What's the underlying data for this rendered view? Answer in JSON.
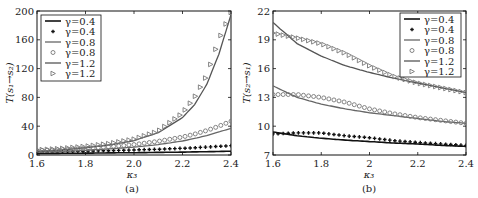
{
  "chart_data": [
    {
      "type": "line",
      "panel": "(a)",
      "title": "",
      "xlabel": "κ3",
      "ylabel": "T(s1→s2)",
      "xlim": [
        1.6,
        2.4
      ],
      "ylim": [
        0,
        200
      ],
      "xticks": [
        "1.6",
        "1.8",
        "2.0",
        "2.2",
        "2.4"
      ],
      "yticks": [
        "0",
        "40",
        "80",
        "120",
        "160",
        "200"
      ],
      "grid": false,
      "legend_position": "upper left",
      "legend": [
        "γ=0.4",
        "γ=0.4",
        "γ=0.8",
        "γ=0.8",
        "γ=1.2",
        "γ=1.2"
      ],
      "x": [
        1.6,
        1.7,
        1.8,
        1.9,
        2.0,
        2.1,
        2.2,
        2.25,
        2.3,
        2.35,
        2.4
      ],
      "series": [
        {
          "name": "γ=0.4",
          "style": "line",
          "color": "#111111",
          "values": [
            2,
            2.3,
            2.6,
            2.9,
            3.2,
            3.6,
            4.0,
            4.3,
            4.6,
            4.9,
            5.2
          ]
        },
        {
          "name": "γ=0.4",
          "style": "dot",
          "color": "#111111",
          "values": [
            4,
            4.6,
            5.3,
            6.0,
            7.0,
            8.0,
            9.3,
            10.1,
            11.0,
            12.0,
            13.0
          ]
        },
        {
          "name": "γ=0.8",
          "style": "line",
          "color": "#666666",
          "values": [
            4,
            5,
            6.5,
            8.5,
            11,
            14.5,
            19.5,
            23,
            27,
            32,
            37
          ]
        },
        {
          "name": "γ=0.8",
          "style": "circle",
          "color": "#777777",
          "values": [
            6,
            7.3,
            9,
            11.5,
            14.5,
            19,
            25,
            29,
            34,
            40,
            47
          ]
        },
        {
          "name": "γ=1.2",
          "style": "line",
          "color": "#555555",
          "values": [
            5,
            7,
            10,
            14,
            20,
            31,
            52,
            70,
            98,
            140,
            195
          ]
        },
        {
          "name": "γ=1.2",
          "style": "triangle",
          "color": "#777777",
          "values": [
            7,
            9,
            12,
            16,
            22,
            33,
            58,
            80,
            110,
            160,
            198
          ]
        }
      ]
    },
    {
      "type": "line",
      "panel": "(b)",
      "title": "",
      "xlabel": "κ3",
      "ylabel": "T(s2→s1)",
      "xlim": [
        1.6,
        2.4
      ],
      "ylim": [
        7,
        22
      ],
      "xticks": [
        "1.6",
        "1.8",
        "2",
        "2.2",
        "2.4"
      ],
      "yticks": [
        "7",
        "10",
        "13",
        "16",
        "19",
        "22"
      ],
      "grid": false,
      "legend_position": "upper right",
      "legend": [
        "γ=0.4",
        "γ=0.4",
        "γ=0.8",
        "γ=0.8",
        "γ=1.2",
        "γ=1.2"
      ],
      "x": [
        1.6,
        1.7,
        1.8,
        1.9,
        2.0,
        2.1,
        2.2,
        2.3,
        2.4
      ],
      "series": [
        {
          "name": "γ=0.4",
          "style": "line",
          "color": "#111111",
          "values": [
            9.4,
            9.0,
            8.75,
            8.55,
            8.4,
            8.25,
            8.15,
            8.0,
            7.9
          ]
        },
        {
          "name": "γ=0.4",
          "style": "dot",
          "color": "#111111",
          "values": [
            9.2,
            9.3,
            9.3,
            9.0,
            8.8,
            8.5,
            8.3,
            8.15,
            8.0
          ]
        },
        {
          "name": "γ=0.8",
          "style": "line",
          "color": "#666666",
          "values": [
            14.2,
            13.0,
            12.3,
            11.8,
            11.4,
            11.1,
            10.8,
            10.5,
            10.3
          ]
        },
        {
          "name": "γ=0.8",
          "style": "circle",
          "color": "#777777",
          "values": [
            13.3,
            13.3,
            13.0,
            12.5,
            11.8,
            11.3,
            10.9,
            10.6,
            10.3
          ]
        },
        {
          "name": "γ=1.2",
          "style": "line",
          "color": "#555555",
          "values": [
            20.8,
            18.6,
            17.3,
            16.3,
            15.6,
            15.0,
            14.5,
            14.0,
            13.5
          ]
        },
        {
          "name": "γ=1.2",
          "style": "triangle",
          "color": "#777777",
          "values": [
            19.7,
            19.2,
            18.6,
            17.6,
            16.3,
            15.2,
            14.5,
            14.0,
            13.5
          ]
        }
      ]
    }
  ],
  "panels": {
    "a": {
      "caption": "(a)",
      "xlabel": "κ₃",
      "ylabel": "T(s₁→s₂)",
      "xticks": [
        "1.6",
        "1.8",
        "2.0",
        "2.2",
        "2.4"
      ],
      "yticks": [
        "0",
        "40",
        "80",
        "120",
        "160",
        "200"
      ],
      "legend": [
        "γ=0.4",
        "γ=0.4",
        "γ=0.8",
        "γ=0.8",
        "γ=1.2",
        "γ=1.2"
      ]
    },
    "b": {
      "caption": "(b)",
      "xlabel": "κ₃",
      "ylabel": "T(s₂→s₁)",
      "xticks": [
        "1.6",
        "1.8",
        "2",
        "2.2",
        "2.4"
      ],
      "yticks": [
        "7",
        "10",
        "13",
        "16",
        "19",
        "22"
      ],
      "legend": [
        "γ=0.4",
        "γ=0.4",
        "γ=0.8",
        "γ=0.8",
        "γ=1.2",
        "γ=1.2"
      ]
    }
  }
}
